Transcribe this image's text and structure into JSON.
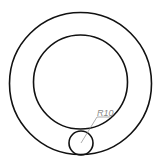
{
  "diagram": {
    "type": "technical-drawing",
    "colors": {
      "line": "#111111",
      "dimension": "#888888",
      "background": "#ffffff"
    },
    "shapes": [
      {
        "name": "outer-circle",
        "cx": 80.5,
        "cy": 83.5,
        "r": 71
      },
      {
        "name": "inner-circle",
        "cx": 80.5,
        "cy": 82,
        "r": 47
      },
      {
        "name": "small-circle",
        "cx": 81,
        "cy": 143,
        "r": 12,
        "dimension": "R10"
      }
    ],
    "dimension_label": "R10"
  }
}
